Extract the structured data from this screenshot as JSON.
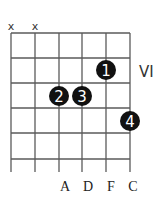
{
  "diagram": {
    "type": "guitar-chord-chart",
    "strings": 6,
    "frets_shown": 5,
    "position_label": "VI",
    "muted_strings": [
      1,
      2
    ],
    "muted_symbol": "x",
    "fingers": [
      {
        "finger": "1",
        "string": 5,
        "fret": 2
      },
      {
        "finger": "2",
        "string": 3,
        "fret": 3
      },
      {
        "finger": "3",
        "string": 4,
        "fret": 3
      },
      {
        "finger": "4",
        "string": 6,
        "fret": 4
      }
    ],
    "string_notes": [
      {
        "string": 3,
        "note": "A"
      },
      {
        "string": 4,
        "note": "D"
      },
      {
        "string": 5,
        "note": "F"
      },
      {
        "string": 6,
        "note": "C"
      }
    ],
    "colors": {
      "grid": "#5a5a5a",
      "dot": "#111111",
      "dot_text": "#ffffff",
      "text": "#222222"
    }
  }
}
